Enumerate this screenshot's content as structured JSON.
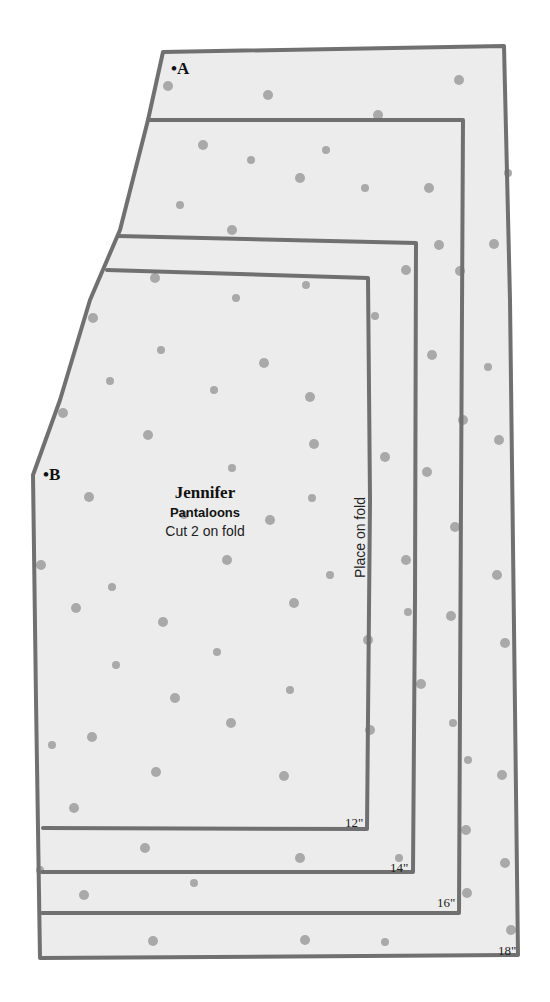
{
  "pattern": {
    "title": "Jennifer",
    "subtitle": "Pantaloons",
    "instruction": "Cut 2 on fold",
    "fold_label": "Place on fold",
    "points": {
      "a": "•A",
      "b": "•B"
    },
    "sizes": [
      {
        "label": "12\""
      },
      {
        "label": "14\""
      },
      {
        "label": "16\""
      },
      {
        "label": "18\""
      }
    ],
    "colors": {
      "paper": "#ececec",
      "line": "#707070",
      "dot": "#a9a9a9",
      "text": "#111111"
    }
  }
}
